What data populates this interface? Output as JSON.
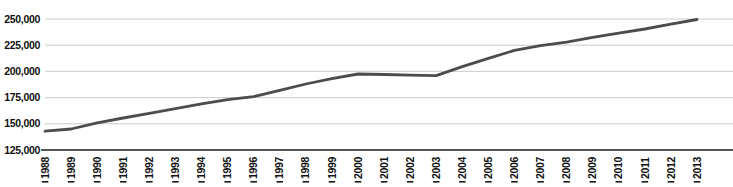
{
  "chart_data": {
    "type": "line",
    "categories": [
      "1988",
      "1989",
      "1990",
      "1991",
      "1992",
      "1993",
      "1994",
      "1995",
      "1996",
      "1997",
      "1998",
      "1999",
      "2000",
      "2001",
      "2002",
      "2003",
      "2004",
      "2005",
      "2006",
      "2007",
      "2008",
      "2009",
      "2010",
      "2011",
      "2012",
      "2013"
    ],
    "values": [
      143000,
      145000,
      151000,
      155500,
      160000,
      164500,
      169000,
      173000,
      176000,
      182000,
      188000,
      193000,
      197500,
      197000,
      196500,
      196000,
      204500,
      212500,
      220000,
      224500,
      228000,
      232500,
      236500,
      240500,
      245000,
      249500
    ],
    "ylim": [
      125000,
      250000
    ],
    "y_tick_values": [
      125000,
      150000,
      175000,
      200000,
      225000,
      250000
    ],
    "y_tick_labels": [
      "125,000",
      "150,000",
      "175,000",
      "200,000",
      "225,000",
      "250,000"
    ],
    "grid": "horizontal",
    "legend_position": "none",
    "x_tick_rotation_deg": -90,
    "colors": {
      "line": "#4c4c4c",
      "gridline": "#cbcbcb",
      "axis": "#1c1c1c",
      "tick_label": "#111111",
      "background": "#ffffff"
    }
  }
}
